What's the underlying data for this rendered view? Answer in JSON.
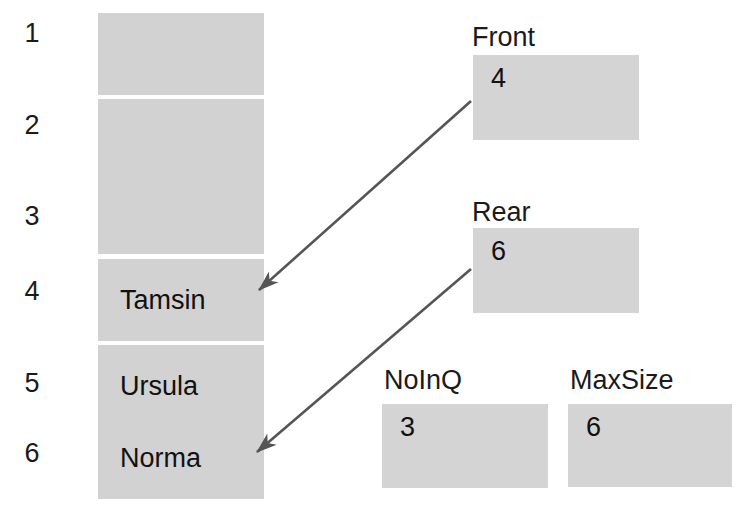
{
  "diagram": {
    "array": {
      "name": "queue-array",
      "cell_fill": "#d2d2d2",
      "indices": [
        "1",
        "2",
        "3",
        "4",
        "5",
        "6"
      ],
      "cells": [
        {
          "index": "1",
          "value": ""
        },
        {
          "index": "2",
          "value": ""
        },
        {
          "index": "3",
          "value": ""
        },
        {
          "index": "4",
          "value": "Tamsin"
        },
        {
          "index": "5",
          "value": "Ursula"
        },
        {
          "index": "6",
          "value": "Norma"
        }
      ]
    },
    "variables": [
      {
        "name": "front",
        "label": "Front",
        "value": "4"
      },
      {
        "name": "rear",
        "label": "Rear",
        "value": "6"
      },
      {
        "name": "noinq",
        "label": "NoInQ",
        "value": "3"
      },
      {
        "name": "maxsize",
        "label": "MaxSize",
        "value": "6"
      }
    ],
    "arrows": [
      {
        "name": "front-to-cell-4",
        "from": "Front",
        "to": "4"
      },
      {
        "name": "rear-to-cell-6",
        "from": "Rear",
        "to": "6"
      }
    ],
    "colors": {
      "box_fill": "#d2d2d2",
      "text": "#111111",
      "arrow": "#555555",
      "background": "#ffffff"
    }
  }
}
